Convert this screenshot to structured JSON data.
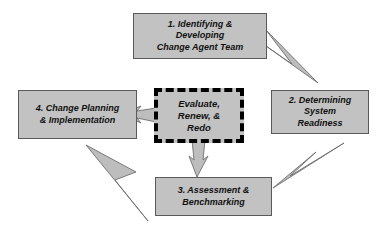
{
  "diagram": {
    "colors": {
      "node_fill": "#c2c2c2",
      "node_border": "#5a5a5a",
      "center_border": "#000000",
      "arrow_fill": "#bdbdbd",
      "arrow_stroke": "#6e6e6e",
      "background": "#ffffff",
      "text": "#111111"
    },
    "nodes": [
      {
        "id": "step-1",
        "label": "1. Identifying &\nDeveloping\nChange Agent Team",
        "border_style": "solid"
      },
      {
        "id": "step-2",
        "label": "2. Determining\nSystem\nReadiness",
        "border_style": "solid"
      },
      {
        "id": "step-3",
        "label": "3. Assessment &\nBenchmarking",
        "border_style": "solid"
      },
      {
        "id": "step-4",
        "label": "4. Change Planning\n& Implementation",
        "border_style": "solid"
      },
      {
        "id": "center",
        "label": "Evaluate,\nRenew, &\nRedo",
        "border_style": "dashed"
      }
    ],
    "arrows": [
      {
        "id": "arrow-1-to-2",
        "from": "step-1",
        "to": "step-2",
        "direction": "down-right"
      },
      {
        "id": "arrow-2-to-3",
        "from": "step-2",
        "to": "step-3",
        "direction": "down-left"
      },
      {
        "id": "arrow-3-to-4",
        "from": "step-3",
        "to": "step-4",
        "direction": "up-left"
      },
      {
        "id": "arrow-center-to-4",
        "from": "center",
        "to": "step-4",
        "direction": "left"
      },
      {
        "id": "arrow-center-to-3",
        "from": "center",
        "to": "step-3",
        "direction": "down"
      }
    ]
  }
}
